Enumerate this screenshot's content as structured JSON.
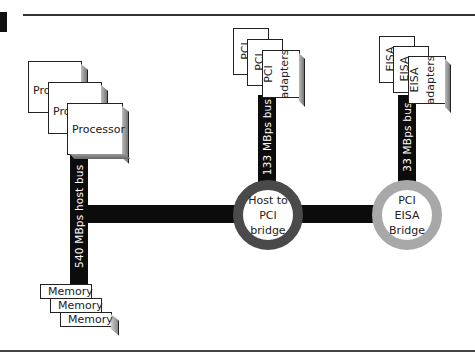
{
  "diagram": {
    "buses": {
      "host_bus": "540 MBps host bus",
      "pci_bus": "133 MBps bus",
      "eisa_bus": "33 MBps bus"
    },
    "processors": [
      "Processor",
      "Processor",
      "Processor"
    ],
    "processor_partial_labels": [
      "Pro",
      "Pro"
    ],
    "memory": [
      "Memory",
      "Memory",
      "Memory"
    ],
    "pci_adapters": {
      "back_labels": [
        "PCI",
        "PCI"
      ],
      "front_line1": "PCI",
      "front_line2": "adapters"
    },
    "eisa_adapters": {
      "back_labels": [
        "EISA",
        "EISA"
      ],
      "front_line1": "EISA",
      "front_line2": "adapters"
    },
    "bridges": {
      "host_to_pci": [
        "Host to",
        "PCI",
        "bridge"
      ],
      "pci_eisa": [
        "PCI",
        "EISA",
        "Bridge"
      ]
    },
    "colors": {
      "bus": "#0c0c0c",
      "host_bridge_ring": "#4a4a4a",
      "eisa_bridge_ring": "#a8a8a8"
    }
  }
}
